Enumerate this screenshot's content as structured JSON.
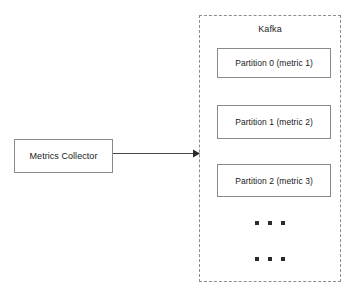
{
  "diagram": {
    "background_color": "#ffffff",
    "stroke_color": "#8a8a8a",
    "dashed_stroke_color": "#8c8c8c",
    "text_color": "#1a1a1a"
  },
  "collector": {
    "label": "Metrics Collector"
  },
  "arrow": {
    "from": "Metrics Collector",
    "to": "Kafka",
    "direction": "right",
    "style": "solid-line-with-filled-arrowhead"
  },
  "kafka": {
    "title": "Kafka",
    "border_style": "dashed",
    "partitions": [
      {
        "label": "Partition 0 (metric 1)"
      },
      {
        "label": "Partition 1 (metric 2)"
      },
      {
        "label": "Partition 2 (metric 3)"
      }
    ],
    "ellipsis_rows": [
      {
        "dots": 3
      },
      {
        "dots": 3
      }
    ]
  }
}
